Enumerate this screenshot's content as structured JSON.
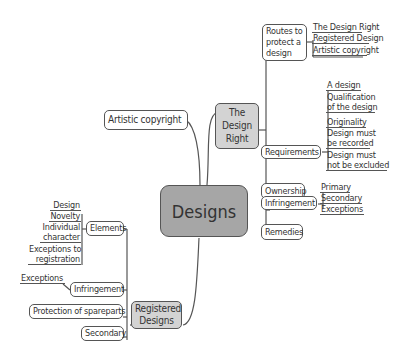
{
  "root": {
    "label": "Designs"
  },
  "design_right": {
    "label": "The Design Right",
    "label_lines": [
      "The",
      "Design",
      "Right"
    ],
    "children": [
      {
        "label": "Routes to protect a design",
        "lines": [
          "Routes to",
          "protect a",
          "design"
        ],
        "leaves": [
          "The Design Right",
          "Registered Design",
          "Artistic copyright"
        ]
      },
      {
        "label": "Requirements",
        "leaves": [
          "A design",
          "Qualification of the design",
          "Originality",
          "Design must be recorded",
          "Design must not be excluded"
        ],
        "leaf_lines": [
          [
            "A design"
          ],
          [
            "Qualification",
            "of the design"
          ],
          [
            "Originality"
          ],
          [
            "Design must",
            "be recorded"
          ],
          [
            "Design must",
            "not be excluded"
          ]
        ]
      },
      {
        "label": "Ownership",
        "leaves": []
      },
      {
        "label": "Infringement",
        "leaves": [
          "Primary",
          "Secondary",
          "Exceptions"
        ]
      },
      {
        "label": "Remedies",
        "leaves": []
      }
    ]
  },
  "artistic_copyright": {
    "label": "Artistic copyright"
  },
  "registered_designs": {
    "label": "Registered Designs",
    "label_lines": [
      "Registered",
      "Designs"
    ],
    "children": [
      {
        "label": "Elements",
        "leaves": [
          "Design",
          "Novelty",
          "Individual character",
          "Exceptions to registration"
        ],
        "leaf_lines": [
          [
            "Design"
          ],
          [
            "Novelty"
          ],
          [
            "Individual",
            "character"
          ],
          [
            "Exceptions to",
            "registration"
          ]
        ]
      },
      {
        "label": "Infringement",
        "leaves": [
          "Exceptions"
        ]
      },
      {
        "label": "Protection of spareparts",
        "leaves": []
      },
      {
        "label": "Secondary",
        "leaves": []
      }
    ]
  },
  "colors": {
    "root_fill": "#a6a6a6",
    "branch_fill": "#d3d3d3",
    "line": "#555555"
  }
}
